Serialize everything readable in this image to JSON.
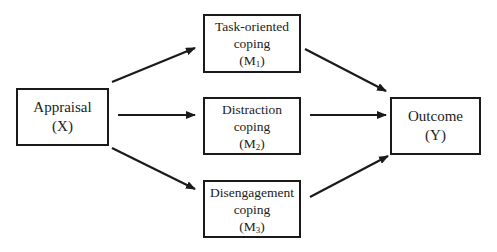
{
  "diagram": {
    "type": "mediation-model",
    "nodes": [
      {
        "id": "appraisal",
        "label": "Appraisal",
        "symbol": "(X)",
        "symbol_base": "X",
        "box": {
          "x": 16,
          "y": 88,
          "w": 93,
          "h": 58
        }
      },
      {
        "id": "task-oriented",
        "label": "Task-oriented",
        "label2": "coping",
        "symbol_base": "M",
        "symbol_sub": "1",
        "box": {
          "x": 203,
          "y": 14,
          "w": 98,
          "h": 59
        }
      },
      {
        "id": "distraction",
        "label": "Distraction",
        "label2": "coping",
        "symbol_base": "M",
        "symbol_sub": "2",
        "box": {
          "x": 203,
          "y": 97,
          "w": 98,
          "h": 58
        }
      },
      {
        "id": "disengagement",
        "label": "Disengagement",
        "label2": "coping",
        "symbol_base": "M",
        "symbol_sub": "3",
        "box": {
          "x": 203,
          "y": 180,
          "w": 98,
          "h": 58
        }
      },
      {
        "id": "outcome",
        "label": "Outcome",
        "symbol": "(Y)",
        "symbol_base": "Y",
        "box": {
          "x": 390,
          "y": 97,
          "w": 91,
          "h": 58
        }
      }
    ],
    "edges": [
      {
        "from": "appraisal",
        "to": "task-oriented",
        "x1": 112,
        "y1": 82,
        "x2": 195,
        "y2": 48
      },
      {
        "from": "appraisal",
        "to": "distraction",
        "x1": 118,
        "y1": 115,
        "x2": 195,
        "y2": 115
      },
      {
        "from": "appraisal",
        "to": "disengagement",
        "x1": 112,
        "y1": 148,
        "x2": 195,
        "y2": 189
      },
      {
        "from": "task-oriented",
        "to": "outcome",
        "x1": 305,
        "y1": 49,
        "x2": 386,
        "y2": 91
      },
      {
        "from": "distraction",
        "to": "outcome",
        "x1": 310,
        "y1": 115,
        "x2": 386,
        "y2": 115
      },
      {
        "from": "disengagement",
        "to": "outcome",
        "x1": 310,
        "y1": 197,
        "x2": 388,
        "y2": 156
      }
    ],
    "colors": {
      "stroke": "#1a1a1a",
      "text": "#222222",
      "background": "#ffffff"
    }
  }
}
